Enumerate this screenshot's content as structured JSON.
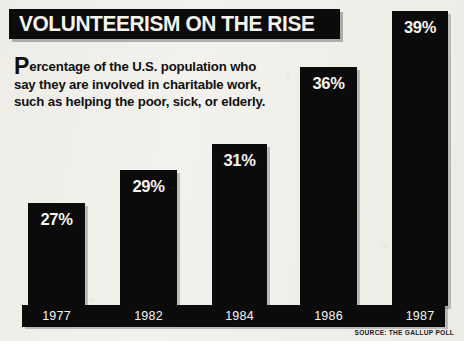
{
  "title": "VOLUNTEERISM ON THE RISE",
  "subtitle": {
    "dropcap": "P",
    "rest": "ercentage of the U.S. population who say they are involved in charitable work, such as helping the poor, sick, or elderly."
  },
  "source": "SOURCE: THE GALLUP POLL",
  "colors": {
    "paper": "#f3f1ec",
    "ink": "#0b0b0b",
    "reverse_text": "#f7f5ef"
  },
  "chart_data": {
    "type": "bar",
    "title": "VOLUNTEERISM ON THE RISE",
    "subtitle": "Percentage of the U.S. population who say they are involved in charitable work, such as helping the poor, sick, or elderly.",
    "categories": [
      "1977",
      "1982",
      "1984",
      "1986",
      "1987"
    ],
    "values": [
      27,
      29,
      31,
      36,
      39
    ],
    "data_labels": [
      "27%",
      "29%",
      "31%",
      "36%",
      "39%"
    ],
    "xlabel": "",
    "ylabel": "",
    "ylim": [
      0,
      43
    ],
    "grid": false,
    "legend": "none",
    "source": "SOURCE: THE GALLUP POLL",
    "units": "percent"
  },
  "bars": [
    {
      "label": "27%",
      "year": "1977",
      "value": 27,
      "x": 28,
      "w": 57,
      "top": 203
    },
    {
      "label": "29%",
      "year": "1982",
      "value": 29,
      "x": 120,
      "w": 57,
      "top": 170
    },
    {
      "label": "31%",
      "year": "1984",
      "value": 31,
      "x": 212,
      "w": 55,
      "top": 144
    },
    {
      "label": "36%",
      "year": "1986",
      "value": 36,
      "x": 300,
      "w": 57,
      "top": 67
    },
    {
      "label": "39%",
      "year": "1987",
      "value": 39,
      "x": 392,
      "w": 56,
      "top": 11
    }
  ]
}
